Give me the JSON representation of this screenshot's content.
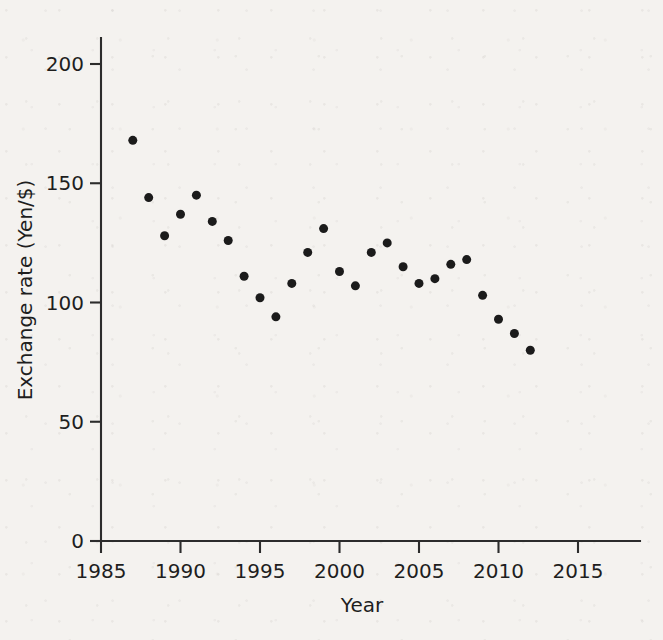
{
  "chart_data": {
    "type": "scatter",
    "title": "",
    "xlabel": "Year",
    "ylabel": "Exchange rate (Yen/$)",
    "xlim": [
      1984,
      2018
    ],
    "ylim": [
      0,
      215
    ],
    "xticks": [
      1985,
      1990,
      1995,
      2000,
      2005,
      2010,
      2015
    ],
    "xtick_labels": [
      "1985",
      "1990",
      "1995",
      "2000",
      "2005",
      "2010",
      "2015"
    ],
    "yticks": [
      0,
      50,
      100,
      150,
      200
    ],
    "ytick_labels": [
      "0",
      "50",
      "100",
      "150",
      "200"
    ],
    "grid": false,
    "legend": null,
    "marker": {
      "shape": "circle",
      "color": "#1b1b1b",
      "size": 9
    },
    "x": [
      1987,
      1988,
      1989,
      1990,
      1991,
      1992,
      1993,
      1994,
      1995,
      1996,
      1997,
      1998,
      1999,
      2000,
      2001,
      2002,
      2003,
      2004,
      2005,
      2006,
      2007,
      2008,
      2009,
      2010,
      2011,
      2012
    ],
    "values": [
      168,
      144,
      128,
      137,
      145,
      134,
      126,
      111,
      102,
      94,
      108,
      121,
      131,
      113,
      107,
      121,
      125,
      115,
      108,
      110,
      116,
      118,
      103,
      93,
      87,
      80
    ],
    "points": [
      {
        "year": 1987,
        "rate": 168
      },
      {
        "year": 1988,
        "rate": 144
      },
      {
        "year": 1989,
        "rate": 128
      },
      {
        "year": 1990,
        "rate": 137
      },
      {
        "year": 1991,
        "rate": 145
      },
      {
        "year": 1992,
        "rate": 134
      },
      {
        "year": 1993,
        "rate": 126
      },
      {
        "year": 1994,
        "rate": 111
      },
      {
        "year": 1995,
        "rate": 102
      },
      {
        "year": 1996,
        "rate": 94
      },
      {
        "year": 1997,
        "rate": 108
      },
      {
        "year": 1998,
        "rate": 121
      },
      {
        "year": 1999,
        "rate": 131
      },
      {
        "year": 2000,
        "rate": 113
      },
      {
        "year": 2001,
        "rate": 107
      },
      {
        "year": 2002,
        "rate": 121
      },
      {
        "year": 2003,
        "rate": 125
      },
      {
        "year": 2004,
        "rate": 115
      },
      {
        "year": 2005,
        "rate": 108
      },
      {
        "year": 2006,
        "rate": 110
      },
      {
        "year": 2007,
        "rate": 116
      },
      {
        "year": 2008,
        "rate": 118
      },
      {
        "year": 2009,
        "rate": 103
      },
      {
        "year": 2010,
        "rate": 93
      },
      {
        "year": 2011,
        "rate": 87
      },
      {
        "year": 2012,
        "rate": 80
      }
    ]
  },
  "colors": {
    "background": "#f4f2ef",
    "axis": "#2c2c2c",
    "text": "#1e1e1e",
    "marker": "#1b1b1b"
  }
}
